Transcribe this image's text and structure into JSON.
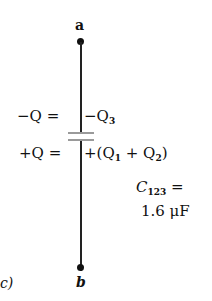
{
  "diagram": {
    "panel_label": "c)",
    "terminal_top": "a",
    "terminal_bottom": "b",
    "top_plate": {
      "left_charge": "−Q =",
      "right_charge_prefix": "−Q",
      "right_charge_sub": "3"
    },
    "bottom_plate": {
      "left_charge": "+Q =",
      "right_charge": "+(Q",
      "right_sub1": "1",
      "right_mid": " + Q",
      "right_sub2": "2",
      "right_close": ")"
    },
    "equivalent": {
      "symbol": "C",
      "subscript": "123",
      "equals": "=",
      "value": "1.6 μF"
    },
    "colors": {
      "wire": "#222222",
      "plates": "#9a9a9a",
      "text": "#111111"
    }
  }
}
